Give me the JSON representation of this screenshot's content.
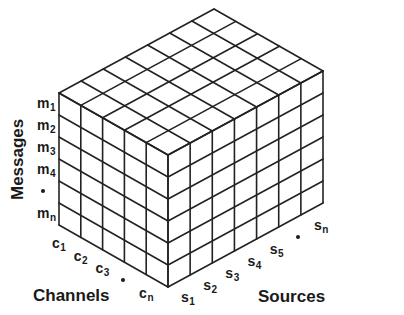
{
  "diagram": {
    "type": "3d-grid-cube",
    "colors": {
      "line": "#222222",
      "text": "#1a1a1a",
      "background": "#ffffff"
    },
    "axes": {
      "messages": {
        "title": "Messages",
        "labels": [
          {
            "base": "m",
            "sub": "1"
          },
          {
            "base": "m",
            "sub": "2"
          },
          {
            "base": "m",
            "sub": "3"
          },
          {
            "base": "m",
            "sub": "4"
          },
          {
            "base": "•",
            "sub": ""
          },
          {
            "base": "m",
            "sub": "n"
          }
        ]
      },
      "channels": {
        "title": "Channels",
        "labels": [
          {
            "base": "c",
            "sub": "1"
          },
          {
            "base": "c",
            "sub": "2"
          },
          {
            "base": "c",
            "sub": "3"
          },
          {
            "base": "•",
            "sub": ""
          },
          {
            "base": "c",
            "sub": "n"
          }
        ]
      },
      "sources": {
        "title": "Sources",
        "labels": [
          {
            "base": "s",
            "sub": "1"
          },
          {
            "base": "s",
            "sub": "2"
          },
          {
            "base": "s",
            "sub": "3"
          },
          {
            "base": "s",
            "sub": "4"
          },
          {
            "base": "s",
            "sub": "5"
          },
          {
            "base": "•",
            "sub": ""
          },
          {
            "base": "s",
            "sub": "n"
          }
        ]
      }
    },
    "grid": {
      "rows": 6,
      "channel_cols": 5,
      "source_cols": 7
    }
  }
}
